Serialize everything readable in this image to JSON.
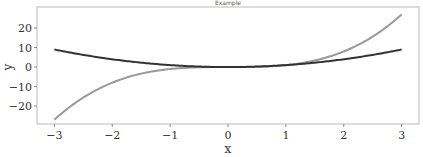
{
  "chart_data": {
    "type": "line",
    "title": "Example",
    "xlabel": "x",
    "ylabel": "y",
    "xlim": [
      -3.3,
      3.3
    ],
    "ylim": [
      -29.2,
      30.8
    ],
    "xticks": [
      -3,
      -2,
      -1,
      0,
      1,
      2,
      3
    ],
    "xtick_labels": [
      "−3",
      "−2",
      "−1",
      "0",
      "1",
      "2",
      "3"
    ],
    "yticks": [
      -20,
      -10,
      0,
      10,
      20
    ],
    "ytick_labels": [
      "−20",
      "−10",
      "0",
      "10",
      "20"
    ],
    "grid": false,
    "legend": null,
    "x_range": [
      -3,
      3
    ],
    "series": [
      {
        "name": "x^3",
        "function": "cubic",
        "color": "#999999",
        "x_start": -3,
        "x_end": 3,
        "y_start": -27,
        "y_end": 27
      },
      {
        "name": "x^2",
        "function": "square",
        "color": "#333333",
        "x_start": -3,
        "x_end": 3,
        "y_start": 9,
        "y_end": 9
      }
    ]
  }
}
